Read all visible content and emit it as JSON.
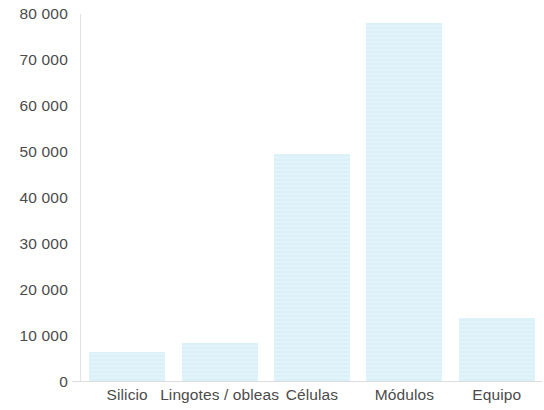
{
  "chart_data": {
    "type": "bar",
    "title": "",
    "subtitle": "",
    "xlabel": "",
    "ylabel": "",
    "categories": [
      "Silicio",
      "Lingotes / obleas",
      "Células",
      "Módulos",
      "Equipo"
    ],
    "values": [
      6500,
      8500,
      49500,
      78000,
      14000
    ],
    "series": [
      {
        "name": "",
        "values": [
          6500,
          8500,
          49500,
          78000,
          14000
        ]
      }
    ],
    "ylim": [
      0,
      80000
    ],
    "ytick_values": [
      0,
      10000,
      20000,
      30000,
      40000,
      50000,
      60000,
      70000,
      80000
    ],
    "ytick_labels": [
      "0",
      "10 000",
      "20 000",
      "30 000",
      "40 000",
      "50 000",
      "60 000",
      "70 000",
      "80 000"
    ],
    "grid": false,
    "legend": "none",
    "bar_color": "#d7f0f8",
    "axis_color": "#dcdcdc",
    "text_color": "#4b4b4b",
    "background_color": "#ffffff"
  }
}
